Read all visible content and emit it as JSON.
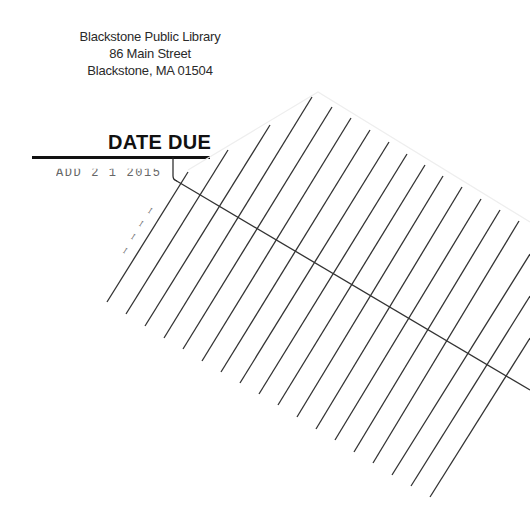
{
  "document": {
    "type": "library date due card",
    "address": {
      "name": "Blackstone Public Library",
      "street": "86 Main Street",
      "city_state_zip": "Blackstone, MA  01504"
    },
    "heading": "DATE DUE",
    "stamps": [
      {
        "text": "APR 2 1 2015",
        "visible_as": "ADD 2 1 2015",
        "partially_cut": true
      },
      {
        "text": "illegible rotated stamp",
        "rotated": true,
        "visible_as": "ꟷ ꟷ ꟷ"
      }
    ],
    "ruled_lines": {
      "count": 18,
      "color": "#333333",
      "lines": [
        [
          107,
          302,
          188,
          172
        ],
        [
          126,
          314,
          228,
          150
        ],
        [
          145,
          326,
          270,
          125
        ],
        [
          164,
          338,
          312,
          97
        ],
        [
          183,
          349,
          332,
          107
        ],
        [
          202,
          361,
          351,
          118
        ],
        [
          221,
          372,
          370,
          130
        ],
        [
          240,
          383,
          389,
          142
        ],
        [
          259,
          394,
          407,
          154
        ],
        [
          278,
          405,
          425,
          165
        ],
        [
          297,
          417,
          443,
          176
        ],
        [
          316,
          429,
          462,
          187
        ],
        [
          335,
          440,
          481,
          199
        ],
        [
          354,
          452,
          500,
          210
        ],
        [
          373,
          463,
          519,
          221
        ],
        [
          392,
          475,
          530,
          254
        ],
        [
          411,
          486,
          530,
          296
        ],
        [
          430,
          497,
          530,
          338
        ]
      ],
      "cross_line": [
        175,
        180,
        530,
        390
      ]
    },
    "card_outline": {
      "points": "188,170 318,92 530,222",
      "color": "#eeeeee"
    }
  }
}
